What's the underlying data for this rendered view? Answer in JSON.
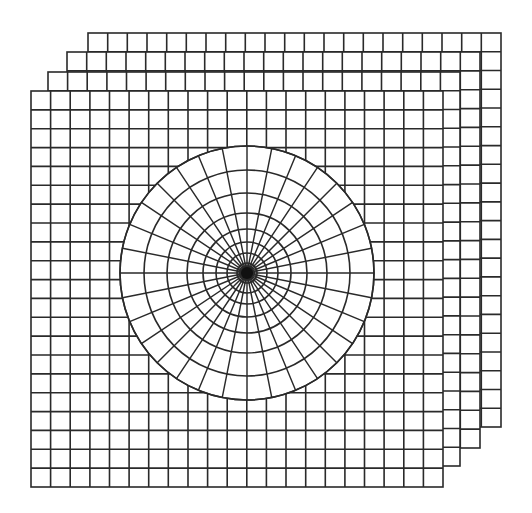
{
  "figure": {
    "width": 532,
    "height": 513,
    "background": "#ffffff",
    "stroke_color": "#2a2a2a",
    "stroke_width": 1.6
  },
  "sheets": [
    {
      "name": "sheet-4",
      "x": 88,
      "y": 33,
      "w": 413,
      "h": 394,
      "cols": 21,
      "rows": 21
    },
    {
      "name": "sheet-3",
      "x": 67,
      "y": 52,
      "w": 413,
      "h": 396,
      "cols": 21,
      "rows": 21
    },
    {
      "name": "sheet-2",
      "x": 48,
      "y": 72,
      "w": 412,
      "h": 394,
      "cols": 21,
      "rows": 21
    },
    {
      "name": "sheet-1-front",
      "x": 31,
      "y": 91,
      "w": 412,
      "h": 396,
      "cols": 21,
      "rows": 21
    }
  ],
  "polar_grid": {
    "cx": 247,
    "cy": 273,
    "outer_radius": 127,
    "ring_radii": [
      10,
      20,
      31,
      44,
      60,
      80,
      103,
      127
    ],
    "spoke_count": 32,
    "center_dot_radius": 6
  }
}
